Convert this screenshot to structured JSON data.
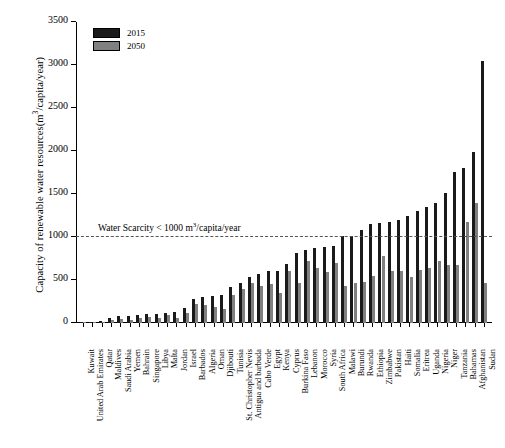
{
  "chart_data": {
    "type": "bar",
    "title": "",
    "subtitle": "",
    "xlabel": "",
    "ylabel": "Capacity of renewable water resources(m3/capita/year)",
    "ylabel_parts": {
      "pre": "Capacity of renewable water resources(m",
      "sup": "3",
      "post": "/capita/year)"
    },
    "ylim": [
      0,
      3500
    ],
    "yticks": [
      0,
      500,
      1000,
      1500,
      2000,
      2500,
      3000,
      3500
    ],
    "ytick_labels": [
      "0",
      "500",
      "1000",
      "1500",
      "2000",
      "2500",
      "3000",
      "3500"
    ],
    "grid": false,
    "legend_position": "top-left",
    "categories": [
      "Kuwait",
      "United Arab Emirates",
      "Qatar",
      "Maldives",
      "Saudi Arabia",
      "Yemen",
      "Bahrain",
      "Singapore",
      "Libya",
      "Malta",
      "Jordan",
      "Israel",
      "Barbados",
      "Algeria",
      "Oman",
      "Djibouti",
      "Tunisia",
      "St. Christopher Nevis",
      "Antigua and barbuda",
      "Cabo Verde",
      "Egypt",
      "Kenya",
      "Cyprus",
      "Burkina Faso",
      "Lebanon",
      "Morocco",
      "Syria",
      "South Africa",
      "Malawi",
      "Burundi",
      "Rwanda",
      "Ethiopia",
      "Zimbabwe",
      "Pakistan",
      "Haiti",
      "Somalia",
      "Eritrea",
      "Uganda",
      "Nigeria",
      "Niger",
      "Tanzania",
      "Bahamas",
      "Afghanistan",
      "Sudan"
    ],
    "series": [
      {
        "name": "2015",
        "color": "#1a1a1a",
        "values": [
          8,
          17,
          27,
          60,
          80,
          82,
          88,
          100,
          110,
          120,
          125,
          180,
          280,
          300,
          310,
          320,
          415,
          465,
          540,
          575,
          600,
          610,
          690,
          810,
          850,
          870,
          880,
          900,
          1010,
          1015,
          1080,
          1150,
          1165,
          1180,
          1200,
          1245,
          1300,
          1350,
          1390,
          1510,
          1755,
          1800,
          1985,
          3050
        ]
      },
      {
        "name": "2050",
        "color": "#808080",
        "values": [
          5,
          10,
          16,
          38,
          47,
          40,
          58,
          65,
          60,
          90,
          62,
          120,
          225,
          215,
          190,
          165,
          330,
          395,
          470,
          430,
          455,
          350,
          600,
          460,
          720,
          640,
          595,
          700,
          430,
          460,
          480,
          545,
          780,
          610,
          600,
          530,
          620,
          640,
          720,
          670,
          680,
          1180,
          1400,
          465
        ]
      }
    ],
    "annotations": [
      {
        "name": "water-scarcity-threshold",
        "text": "Water Scarcity < 1000 m3/capita/year",
        "text_parts": {
          "pre": "Water Scarcity < 1000 m",
          "sup": "3",
          "post": "/capita/year"
        },
        "y": 1000,
        "line_style": "dashed"
      }
    ]
  },
  "legend": {
    "items": [
      {
        "label": "2015",
        "color": "#1a1a1a"
      },
      {
        "label": "2050",
        "color": "#808080"
      }
    ]
  }
}
